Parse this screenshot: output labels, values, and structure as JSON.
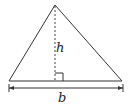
{
  "diagram": {
    "labels": {
      "height": "h",
      "base": "b"
    },
    "colors": {
      "stroke": "#333333",
      "background": "#ffffff"
    }
  }
}
